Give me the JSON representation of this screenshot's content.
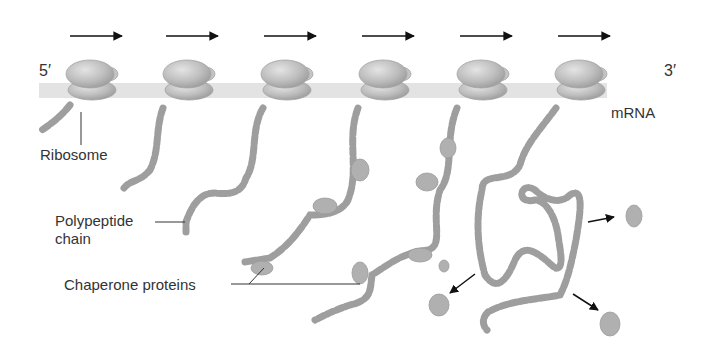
{
  "diagram": {
    "direction_arrows_count": 6,
    "ribosome_count": 6,
    "labels": {
      "five_prime": "5′",
      "three_prime": "3′",
      "mrna": "mRNA",
      "ribosome": "Ribosome",
      "polypeptide_line1": "Polypeptide",
      "polypeptide_line2": "chain",
      "chaperone": "Chaperone proteins"
    },
    "colors": {
      "mrna_strand": "#e3e3e3",
      "ribosome": "#b8b8b8",
      "chain_bead": "#9e9e9e",
      "chaperone": "#b0b0b0",
      "arrow": "#111111",
      "text": "#333333"
    }
  }
}
